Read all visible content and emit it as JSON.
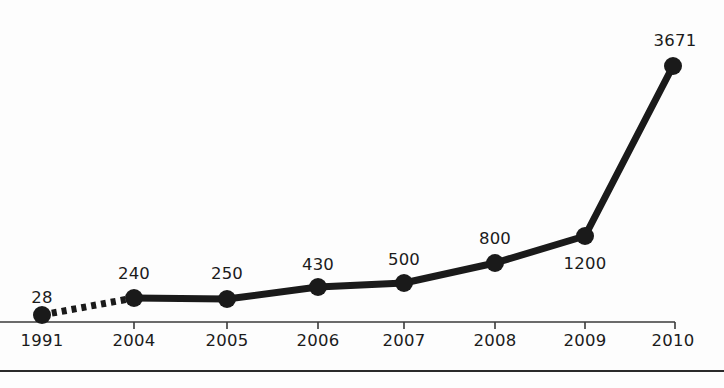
{
  "chart_data": {
    "type": "line",
    "title": "",
    "subtitle": "",
    "xlabel": "",
    "ylabel": "",
    "categories": [
      "1991",
      "2004",
      "2005",
      "2006",
      "2007",
      "2008",
      "2009",
      "2010"
    ],
    "values": [
      28,
      240,
      250,
      430,
      500,
      800,
      1200,
      3671
    ],
    "value_labels": [
      "28",
      "240",
      "250",
      "430",
      "500",
      "800",
      "1200",
      "3671"
    ],
    "tick_labels": [
      "1991",
      "2004",
      "2005",
      "2006",
      "2007",
      "2008",
      "2009",
      "2010"
    ],
    "series": [
      {
        "name": "series-1",
        "values": [
          28,
          240,
          250,
          430,
          500,
          800,
          1200,
          3671
        ]
      }
    ],
    "ylim": [
      0,
      3671
    ],
    "grid": false,
    "legend": false,
    "legend_position": "none",
    "annotations": [
      "First segment (1991 to 2004) drawn as a dashed line",
      "Data value labels shown above each marker except 1200 which is below"
    ],
    "style": {
      "line_color": "#1a1a1a",
      "marker_color": "#1a1a1a",
      "axis_color": "#3a3a3a",
      "background": "#fdfdfd",
      "line_width": 7,
      "marker_radius": 9
    },
    "points": [
      {
        "label": "1991",
        "value": "28",
        "x": 42,
        "y": 315,
        "label_x": 42,
        "label_y": 290,
        "label_pos": "above",
        "dashed_to_next": true
      },
      {
        "label": "2004",
        "value": "240",
        "x": 134,
        "y": 298,
        "label_x": 134,
        "label_y": 266,
        "label_pos": "above",
        "dashed_to_next": false
      },
      {
        "label": "2005",
        "value": "250",
        "x": 227,
        "y": 299,
        "label_x": 227,
        "label_y": 266,
        "label_pos": "above",
        "dashed_to_next": false
      },
      {
        "label": "2006",
        "value": "430",
        "x": 318,
        "y": 287,
        "label_x": 318,
        "label_y": 257,
        "label_pos": "above",
        "dashed_to_next": false
      },
      {
        "label": "2007",
        "value": "500",
        "x": 404,
        "y": 283,
        "label_x": 404,
        "label_y": 252,
        "label_pos": "above",
        "dashed_to_next": false
      },
      {
        "label": "2008",
        "value": "800",
        "x": 495,
        "y": 263,
        "label_x": 495,
        "label_y": 231,
        "label_pos": "above",
        "dashed_to_next": false
      },
      {
        "label": "2009",
        "value": "1200",
        "x": 585,
        "y": 236,
        "label_x": 585,
        "label_y": 256,
        "label_pos": "below",
        "dashed_to_next": false
      },
      {
        "label": "2010",
        "value": "3671",
        "x": 673,
        "y": 66,
        "label_x": 675,
        "label_y": 33,
        "label_pos": "above",
        "dashed_to_next": false
      }
    ],
    "axis": {
      "x_start": 0,
      "x_end": 675,
      "y": 322,
      "tick_length": 7,
      "tick_positions": [
        134,
        227,
        318,
        404,
        495,
        585,
        675
      ],
      "year_label_y": 333
    },
    "footer_rule": {
      "y": 370
    }
  }
}
